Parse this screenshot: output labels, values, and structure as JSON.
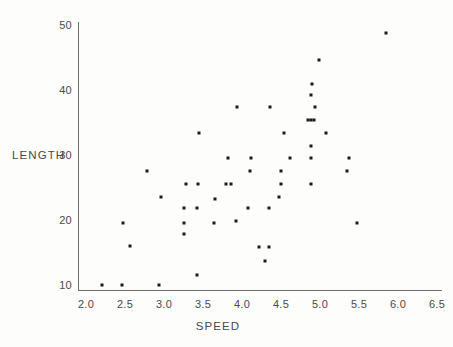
{
  "chart_data": {
    "type": "scatter",
    "title": "",
    "xlabel": "SPEED",
    "ylabel": "LENGTH",
    "xlim": [
      2.0,
      6.5
    ],
    "ylim": [
      8.0,
      51.5
    ],
    "xticks": [
      "2.0",
      "2.5",
      "3.0",
      "3.5",
      "4.0",
      "4.5",
      "5.0",
      "5.5",
      "6.0",
      "6.5"
    ],
    "xtick_values": [
      2.0,
      2.5,
      3.0,
      3.5,
      4.0,
      4.5,
      5.0,
      5.5,
      6.0,
      6.5
    ],
    "yticks": [
      "10",
      "20",
      "30",
      "40",
      "50"
    ],
    "ytick_values": [
      10,
      20,
      30,
      40,
      50
    ],
    "grid": false,
    "legend": null,
    "marker": {
      "shape": "square",
      "size_px": 3,
      "color": "#1a1a1a"
    },
    "points": [
      {
        "x": 2.2,
        "y": 10.0
      },
      {
        "x": 2.46,
        "y": 10.0
      },
      {
        "x": 2.47,
        "y": 19.6
      },
      {
        "x": 2.57,
        "y": 16.0
      },
      {
        "x": 2.78,
        "y": 27.5
      },
      {
        "x": 2.94,
        "y": 10.0
      },
      {
        "x": 2.96,
        "y": 23.6
      },
      {
        "x": 3.26,
        "y": 17.8
      },
      {
        "x": 3.26,
        "y": 19.6
      },
      {
        "x": 3.26,
        "y": 21.8
      },
      {
        "x": 3.28,
        "y": 25.6
      },
      {
        "x": 3.42,
        "y": 11.6
      },
      {
        "x": 3.42,
        "y": 21.8
      },
      {
        "x": 3.43,
        "y": 25.6
      },
      {
        "x": 3.45,
        "y": 33.4
      },
      {
        "x": 3.64,
        "y": 19.6
      },
      {
        "x": 3.66,
        "y": 23.2
      },
      {
        "x": 3.8,
        "y": 25.6
      },
      {
        "x": 3.82,
        "y": 29.5
      },
      {
        "x": 3.86,
        "y": 25.6
      },
      {
        "x": 3.92,
        "y": 19.8
      },
      {
        "x": 3.94,
        "y": 37.4
      },
      {
        "x": 4.08,
        "y": 21.8
      },
      {
        "x": 4.1,
        "y": 27.6
      },
      {
        "x": 4.12,
        "y": 29.6
      },
      {
        "x": 4.22,
        "y": 15.8
      },
      {
        "x": 4.3,
        "y": 13.7
      },
      {
        "x": 4.34,
        "y": 15.8
      },
      {
        "x": 4.34,
        "y": 21.8
      },
      {
        "x": 4.36,
        "y": 37.4
      },
      {
        "x": 4.48,
        "y": 23.6
      },
      {
        "x": 4.5,
        "y": 25.6
      },
      {
        "x": 4.5,
        "y": 27.6
      },
      {
        "x": 4.54,
        "y": 33.4
      },
      {
        "x": 4.62,
        "y": 29.5
      },
      {
        "x": 4.84,
        "y": 35.4
      },
      {
        "x": 4.88,
        "y": 25.6
      },
      {
        "x": 4.88,
        "y": 29.5
      },
      {
        "x": 4.88,
        "y": 31.4
      },
      {
        "x": 4.88,
        "y": 35.4
      },
      {
        "x": 4.89,
        "y": 39.2
      },
      {
        "x": 4.9,
        "y": 41.0
      },
      {
        "x": 4.92,
        "y": 35.4
      },
      {
        "x": 4.94,
        "y": 37.4
      },
      {
        "x": 4.99,
        "y": 44.6
      },
      {
        "x": 5.08,
        "y": 33.4
      },
      {
        "x": 5.35,
        "y": 27.6
      },
      {
        "x": 5.37,
        "y": 29.5
      },
      {
        "x": 5.48,
        "y": 19.6
      },
      {
        "x": 5.85,
        "y": 48.8
      }
    ]
  },
  "axes": {
    "y_title": "LENGTH",
    "x_title": "SPEED"
  }
}
